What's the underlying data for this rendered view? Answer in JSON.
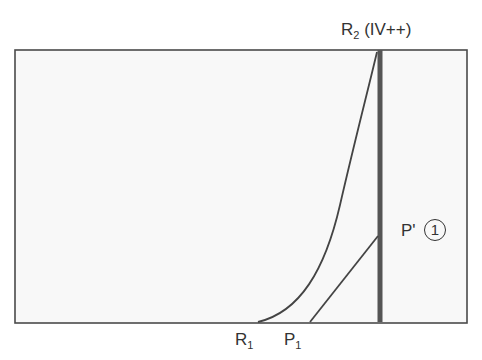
{
  "diagram": {
    "labels": {
      "r2": {
        "main": "R",
        "sub": "2",
        "suffix": " (IV++)"
      },
      "p_prime": {
        "main": "P'"
      },
      "p_prime_marker": "1",
      "r1": {
        "main": "R",
        "sub": "1"
      },
      "p1": {
        "main": "P",
        "sub": "1"
      }
    },
    "colors": {
      "frame": "#4a4a4a",
      "thick_line": "#555555",
      "curve": "#444444",
      "text": "#333333",
      "background_inside": "#f7f7f7"
    },
    "elements": [
      "frame box",
      "thick vertical line at R2 (IV++)",
      "curve from R1 to top of R2",
      "straight line from P1 to P' on R2 line"
    ]
  }
}
